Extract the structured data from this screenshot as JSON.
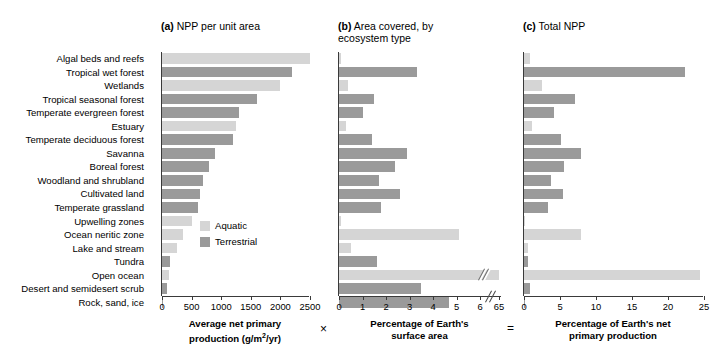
{
  "figure": {
    "legend": {
      "aquatic_label": "Aquatic",
      "terrestrial_label": "Terrestrial",
      "aquatic_color": "#d5d5d5",
      "terrestrial_color": "#9a9a9a"
    },
    "operators": {
      "multiply": "×",
      "equals": "="
    },
    "categories": [
      {
        "name": "Algal beds and reefs",
        "type": "Aquatic"
      },
      {
        "name": "Tropical wet forest",
        "type": "Terrestrial"
      },
      {
        "name": "Wetlands",
        "type": "Aquatic"
      },
      {
        "name": "Tropical seasonal forest",
        "type": "Terrestrial"
      },
      {
        "name": "Temperate evergreen forest",
        "type": "Terrestrial"
      },
      {
        "name": "Estuary",
        "type": "Aquatic"
      },
      {
        "name": "Temperate deciduous forest",
        "type": "Terrestrial"
      },
      {
        "name": "Savanna",
        "type": "Terrestrial"
      },
      {
        "name": "Boreal forest",
        "type": "Terrestrial"
      },
      {
        "name": "Woodland and shrubland",
        "type": "Terrestrial"
      },
      {
        "name": "Cultivated land",
        "type": "Terrestrial"
      },
      {
        "name": "Temperate grassland",
        "type": "Terrestrial"
      },
      {
        "name": "Upwelling zones",
        "type": "Aquatic"
      },
      {
        "name": "Ocean neritic zone",
        "type": "Aquatic"
      },
      {
        "name": "Lake and stream",
        "type": "Aquatic"
      },
      {
        "name": "Tundra",
        "type": "Terrestrial"
      },
      {
        "name": "Open ocean",
        "type": "Aquatic"
      },
      {
        "name": "Desert and semidesert scrub",
        "type": "Terrestrial"
      },
      {
        "name": "Rock, sand, ice",
        "type": "Terrestrial"
      }
    ]
  },
  "chart_data": [
    {
      "type": "bar",
      "panel": "a",
      "title": "(a) NPP per unit area",
      "title_prefix": "(a)",
      "title_text": " NPP per unit area",
      "orientation": "horizontal",
      "xlabel": "Average net primary production (g/m2/yr)",
      "xlabel_line1": "Average net primary",
      "xlabel_line2": "production (g/m",
      "xlabel_sup": "2",
      "xlabel_line2b": "/yr)",
      "ylabel": "",
      "xlim": [
        0,
        2500
      ],
      "xticks": [
        0,
        500,
        1000,
        1500,
        2000,
        2500
      ],
      "xticklabels": [
        "0",
        "500",
        "1000",
        "1500",
        "2000",
        "2500"
      ],
      "grid": false,
      "categories": [
        "Algal beds and reefs",
        "Tropical wet forest",
        "Wetlands",
        "Tropical seasonal forest",
        "Temperate evergreen forest",
        "Estuary",
        "Temperate deciduous forest",
        "Savanna",
        "Boreal forest",
        "Woodland and shrubland",
        "Cultivated land",
        "Temperate grassland",
        "Upwelling zones",
        "Ocean neritic zone",
        "Lake and stream",
        "Tundra",
        "Open ocean",
        "Desert and semidesert scrub",
        "Rock, sand, ice"
      ],
      "values": [
        2500,
        2200,
        2000,
        1600,
        1300,
        1250,
        1200,
        900,
        800,
        700,
        650,
        600,
        500,
        360,
        250,
        140,
        125,
        90,
        3
      ],
      "series_types": [
        "Aquatic",
        "Terrestrial",
        "Aquatic",
        "Terrestrial",
        "Terrestrial",
        "Aquatic",
        "Terrestrial",
        "Terrestrial",
        "Terrestrial",
        "Terrestrial",
        "Terrestrial",
        "Terrestrial",
        "Aquatic",
        "Aquatic",
        "Aquatic",
        "Terrestrial",
        "Aquatic",
        "Terrestrial",
        "Terrestrial"
      ]
    },
    {
      "type": "bar",
      "panel": "b",
      "title": "(b) Area covered, by ecosystem type",
      "title_prefix": "(b)",
      "title_text": " Area covered, by\necosystem type",
      "orientation": "horizontal",
      "xlabel": "Percentage of Earth's surface area",
      "xlabel_line1": "Percentage of Earth's",
      "xlabel_line2": "surface area",
      "xlim": [
        0,
        6
      ],
      "xticks": [
        0,
        1,
        2,
        3,
        4,
        5,
        6,
        65
      ],
      "xticklabels": [
        "0",
        "1",
        "2",
        "3",
        "4",
        "5",
        "6",
        "65"
      ],
      "axis_break": {
        "after": 6,
        "then": 65
      },
      "grid": false,
      "categories": [
        "Algal beds and reefs",
        "Tropical wet forest",
        "Wetlands",
        "Tropical seasonal forest",
        "Temperate evergreen forest",
        "Estuary",
        "Temperate deciduous forest",
        "Savanna",
        "Boreal forest",
        "Woodland and shrubland",
        "Cultivated land",
        "Temperate grassland",
        "Upwelling zones",
        "Ocean neritic zone",
        "Lake and stream",
        "Tundra",
        "Open ocean",
        "Desert and semidesert scrub",
        "Rock, sand, ice"
      ],
      "values": [
        0.1,
        3.3,
        0.4,
        1.5,
        1.0,
        0.3,
        1.4,
        2.9,
        2.4,
        1.7,
        2.6,
        1.8,
        0.1,
        5.1,
        0.5,
        1.6,
        65,
        3.5,
        4.7
      ],
      "series_types": [
        "Aquatic",
        "Terrestrial",
        "Aquatic",
        "Terrestrial",
        "Terrestrial",
        "Aquatic",
        "Terrestrial",
        "Terrestrial",
        "Terrestrial",
        "Terrestrial",
        "Terrestrial",
        "Terrestrial",
        "Aquatic",
        "Aquatic",
        "Aquatic",
        "Terrestrial",
        "Aquatic",
        "Terrestrial",
        "Terrestrial"
      ]
    },
    {
      "type": "bar",
      "panel": "c",
      "title": "(c) Total NPP",
      "title_prefix": "(c)",
      "title_text": " Total NPP",
      "orientation": "horizontal",
      "xlabel": "Percentage of Earth's net primary production",
      "xlabel_line1": "Percentage of Earth's net",
      "xlabel_line2": "primary production",
      "xlim": [
        0,
        25
      ],
      "xticks": [
        0,
        5,
        10,
        15,
        20,
        25
      ],
      "xticklabels": [
        "0",
        "5",
        "10",
        "15",
        "20",
        "25"
      ],
      "grid": false,
      "categories": [
        "Algal beds and reefs",
        "Tropical wet forest",
        "Wetlands",
        "Tropical seasonal forest",
        "Temperate evergreen forest",
        "Estuary",
        "Temperate deciduous forest",
        "Savanna",
        "Boreal forest",
        "Woodland and shrubland",
        "Cultivated land",
        "Temperate grassland",
        "Upwelling zones",
        "Ocean neritic zone",
        "Lake and stream",
        "Tundra",
        "Open ocean",
        "Desert and semidesert scrub",
        "Rock, sand, ice"
      ],
      "values": [
        0.9,
        22.3,
        2.5,
        7.1,
        4.2,
        1.1,
        5.2,
        7.9,
        5.6,
        3.7,
        5.4,
        3.3,
        0.2,
        7.9,
        0.5,
        0.6,
        24.4,
        0.8,
        0.1
      ],
      "series_types": [
        "Aquatic",
        "Terrestrial",
        "Aquatic",
        "Terrestrial",
        "Terrestrial",
        "Aquatic",
        "Terrestrial",
        "Terrestrial",
        "Terrestrial",
        "Terrestrial",
        "Terrestrial",
        "Terrestrial",
        "Aquatic",
        "Aquatic",
        "Aquatic",
        "Terrestrial",
        "Aquatic",
        "Terrestrial",
        "Terrestrial"
      ]
    }
  ]
}
